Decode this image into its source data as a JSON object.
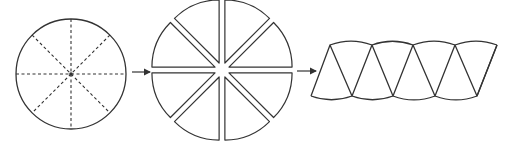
{
  "diagram": {
    "stroke_color": "#333333",
    "background": "#ffffff",
    "stages": [
      {
        "id": "divided-circle",
        "sectors": 8,
        "cx": 71,
        "cy": 74,
        "r": 55,
        "divider_style": "dashed"
      },
      {
        "id": "separated-sectors",
        "sectors": 8,
        "cx": 222,
        "cy": 70,
        "r": 65,
        "gap": 5
      },
      {
        "id": "rearranged-strip",
        "sectors": 8,
        "top_y": 45,
        "bottom_y": 96,
        "top_points_x": [
          330,
          372,
          413,
          455,
          497
        ],
        "bottom_points_x": [
          311,
          352,
          393,
          435,
          477
        ]
      }
    ],
    "arrows": [
      {
        "id": "arrow-1",
        "x1": 132,
        "x2": 150,
        "y": 72
      },
      {
        "id": "arrow-2",
        "x1": 297,
        "x2": 316,
        "y": 71
      }
    ]
  }
}
